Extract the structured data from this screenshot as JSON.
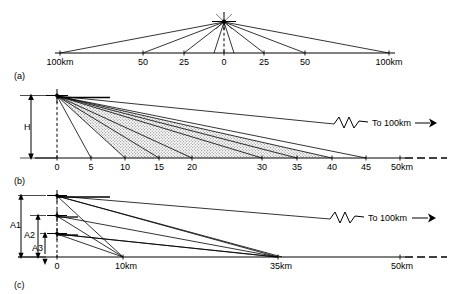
{
  "figure": {
    "background": "#ffffff",
    "ink": "#000000",
    "stipple_fill": "#b9b9b9",
    "panels": [
      {
        "id": "a",
        "label": "(a)",
        "axis": {
          "type": "ground-range-symmetric",
          "unit": "km",
          "ticks": [
            {
              "label": "100km",
              "value": -100
            },
            {
              "label": "50",
              "value": -50
            },
            {
              "label": "25",
              "value": -25
            },
            {
              "label": "0",
              "value": 0
            },
            {
              "label": "25",
              "value": 25
            },
            {
              "label": "50",
              "value": 50
            },
            {
              "label": "100km",
              "value": 100
            }
          ]
        },
        "source": {
          "marker": "starburst-cross",
          "height_line": "dashed-vertical"
        },
        "rays": [
          -100,
          -50,
          -25,
          -5,
          5,
          25,
          50,
          100
        ]
      },
      {
        "id": "b",
        "label": "(b)",
        "height_label": "H",
        "axis": {
          "type": "ground-range",
          "unit": "km",
          "ticks": [
            {
              "label": "0",
              "value": 0
            },
            {
              "label": "5",
              "value": 5
            },
            {
              "label": "10",
              "value": 10
            },
            {
              "label": "15",
              "value": 15
            },
            {
              "label": "20",
              "value": 20
            },
            {
              "label": "30",
              "value": 30
            },
            {
              "label": "35",
              "value": 35
            },
            {
              "label": "40",
              "value": 40
            },
            {
              "label": "45",
              "value": 45
            },
            {
              "label": "50km",
              "value": 50
            }
          ]
        },
        "break_annotation": {
          "symbol": "zigzag-break",
          "text": "To 100km",
          "arrow": "right-filled"
        },
        "source": {
          "marker": "cross",
          "height_line": "dashed-vertical"
        },
        "rays": [
          5,
          10,
          15,
          20,
          30,
          35,
          40,
          45
        ],
        "shaded_bands": [
          {
            "from": 10,
            "to": 20
          },
          {
            "from": 15,
            "to": 35
          }
        ]
      },
      {
        "id": "c",
        "label": "(c)",
        "height_labels": [
          "A1",
          "A2",
          "A3"
        ],
        "axis": {
          "type": "ground-range",
          "unit": "km",
          "ticks": [
            {
              "label": "0",
              "value": 0
            },
            {
              "label": "10km",
              "value": 10
            },
            {
              "label": "35km",
              "value": 35
            },
            {
              "label": "50km",
              "value": 50
            }
          ]
        },
        "break_annotation": {
          "symbol": "zigzag-break",
          "text": "To 100km",
          "arrow": "right-filled"
        },
        "sources": [
          {
            "name": "A1",
            "marker": "cross"
          },
          {
            "name": "A2",
            "marker": "cross"
          },
          {
            "name": "A3",
            "marker": "cross"
          }
        ],
        "convergence_points": [
          10,
          35
        ]
      }
    ]
  }
}
